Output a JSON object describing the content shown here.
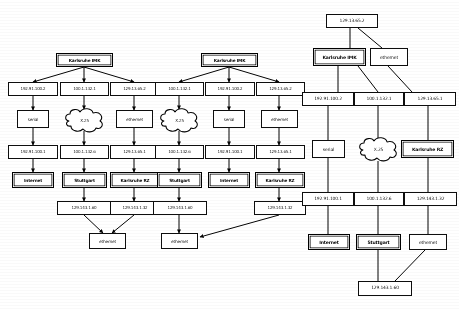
{
  "page": {
    "kind": "network-topology-diagrams",
    "count": 3,
    "background": "#ffffff",
    "ink": "#111111"
  },
  "labels": {
    "karlsruhe_imk": "Karlsruhe IMK",
    "karlsruhe_rz": "Karlsruhe RZ",
    "internet": "Internet",
    "stuttgart": "Stuttgart",
    "serial": "serial",
    "ethernet": "ethernet",
    "x25": "X.25"
  },
  "addresses": {
    "a_192_91_100_2": "192.91.100.2",
    "a_192_91_100_1": "192.91.100.1",
    "a_100_1_132_1": "100.1.132.1",
    "a_100_1_132_6": "100.1.132.6",
    "a_129_13_65_2": "129.13.65.2",
    "a_129_13_65_1": "129.13.65.1",
    "a_129_143_1_60": "129.143.1.60",
    "a_129_143_1_32": "129.143.1.32"
  },
  "diagrams": [
    {
      "id": "diagram-1",
      "name": "topology-serial-x25-ethernet",
      "root": "Karlsruhe IMK",
      "edge_style": "arrow",
      "nodes": [
        {
          "key": "root",
          "type": "host",
          "text": "Karlsruhe IMK"
        },
        {
          "key": "addr_l",
          "type": "addr",
          "text": "192.91.100.2"
        },
        {
          "key": "addr_c",
          "type": "addr",
          "text": "100.1.132.1"
        },
        {
          "key": "addr_r",
          "type": "addr",
          "text": "129.13.65.2"
        },
        {
          "key": "media_l",
          "type": "media",
          "text": "serial"
        },
        {
          "key": "media_c",
          "type": "cloud",
          "text": "X.25"
        },
        {
          "key": "media_r",
          "type": "media",
          "text": "ethernet"
        },
        {
          "key": "addr2_l",
          "type": "addr",
          "text": "192.91.100.1"
        },
        {
          "key": "addr2_c",
          "type": "addr",
          "text": "100.1.132.6"
        },
        {
          "key": "addr2_r",
          "type": "addr",
          "text": "129.13.65.1"
        },
        {
          "key": "host_l",
          "type": "host",
          "text": "Internet"
        },
        {
          "key": "host_c",
          "type": "host",
          "text": "Stuttgart"
        },
        {
          "key": "host_r",
          "type": "host",
          "text": "Karlsruhe RZ"
        },
        {
          "key": "addr3_c",
          "type": "addr",
          "text": "129.143.1.60"
        },
        {
          "key": "addr3_r",
          "type": "addr",
          "text": "129.143.1.32"
        },
        {
          "key": "media_b",
          "type": "media",
          "text": "ethernet"
        }
      ]
    },
    {
      "id": "diagram-2",
      "name": "topology-x25-serial-ethernet",
      "root": "Karlsruhe IMK",
      "edge_style": "arrow",
      "nodes": [
        {
          "key": "root",
          "type": "host",
          "text": "Karlsruhe IMK"
        },
        {
          "key": "addr_l",
          "type": "addr",
          "text": "100.1.132.1"
        },
        {
          "key": "addr_c",
          "type": "addr",
          "text": "192.91.100.2"
        },
        {
          "key": "addr_r",
          "type": "addr",
          "text": "129.13.65.2"
        },
        {
          "key": "media_l",
          "type": "cloud",
          "text": "X.25"
        },
        {
          "key": "media_c",
          "type": "media",
          "text": "serial"
        },
        {
          "key": "media_r",
          "type": "media",
          "text": "ethernet"
        },
        {
          "key": "addr2_l",
          "type": "addr",
          "text": "100.1.132.6"
        },
        {
          "key": "addr2_c",
          "type": "addr",
          "text": "192.91.100.1"
        },
        {
          "key": "addr2_r",
          "type": "addr",
          "text": "129.13.65.1"
        },
        {
          "key": "host_l",
          "type": "host",
          "text": "Stuttgart"
        },
        {
          "key": "host_c",
          "type": "host",
          "text": "Internet"
        },
        {
          "key": "host_r",
          "type": "host",
          "text": "Karlsruhe RZ"
        },
        {
          "key": "addr3_l",
          "type": "addr",
          "text": "129.143.1.60"
        },
        {
          "key": "addr3_r",
          "type": "addr",
          "text": "129.143.1.32"
        },
        {
          "key": "media_b",
          "type": "media",
          "text": "ethernet"
        }
      ]
    },
    {
      "id": "diagram-3",
      "name": "topology-rooted-at-ethernet-address",
      "root": "129.13.65.2",
      "edge_style": "plain",
      "nodes": [
        {
          "key": "top",
          "type": "addr",
          "text": "129.13.65.2"
        },
        {
          "key": "imk",
          "type": "host",
          "text": "Karlsruhe IMK"
        },
        {
          "key": "eth_top",
          "type": "media",
          "text": "ethernet"
        },
        {
          "key": "addr_l",
          "type": "addr",
          "text": "192.91.100.2"
        },
        {
          "key": "addr_c",
          "type": "addr",
          "text": "100.1.132.1"
        },
        {
          "key": "addr_r",
          "type": "addr",
          "text": "129.13.65.1"
        },
        {
          "key": "serial",
          "type": "media",
          "text": "serial"
        },
        {
          "key": "x25",
          "type": "cloud",
          "text": "X.25"
        },
        {
          "key": "krz",
          "type": "host",
          "text": "Karlsruhe RZ"
        },
        {
          "key": "addr2_l",
          "type": "addr",
          "text": "192.91.100.1"
        },
        {
          "key": "addr2_c",
          "type": "addr",
          "text": "100.1.132.6"
        },
        {
          "key": "addr2_r",
          "type": "addr",
          "text": "129.143.1.32"
        },
        {
          "key": "internet",
          "type": "host",
          "text": "Internet"
        },
        {
          "key": "stuttgart",
          "type": "host",
          "text": "Stuttgart"
        },
        {
          "key": "eth_bot",
          "type": "media",
          "text": "ethernet"
        },
        {
          "key": "bottom",
          "type": "addr",
          "text": "129.143.1.60"
        }
      ]
    }
  ]
}
